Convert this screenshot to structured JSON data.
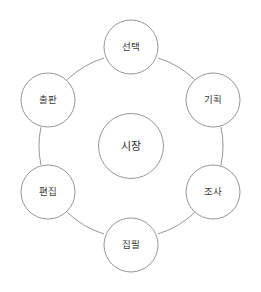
{
  "diagram": {
    "type": "cycle-wheel",
    "title": "",
    "center": {
      "id": "center-node",
      "label": "시장",
      "cx": 131,
      "cy": 146,
      "r": 32.5
    },
    "ring": {
      "cx": 131,
      "cy": 146,
      "r": 92,
      "stroke_color": "#8a8a8a"
    },
    "nodes": [
      {
        "id": "node-top",
        "label": "선택",
        "cx": 131,
        "cy": 47,
        "r": 27,
        "angle_deg": -90
      },
      {
        "id": "node-upper-right",
        "label": "기획",
        "cx": 213,
        "cy": 100,
        "r": 27,
        "angle_deg": -30
      },
      {
        "id": "node-lower-right",
        "label": "조사",
        "cx": 213,
        "cy": 192,
        "r": 27,
        "angle_deg": 30
      },
      {
        "id": "node-bottom",
        "label": "집필",
        "cx": 131,
        "cy": 245,
        "r": 27,
        "angle_deg": 90
      },
      {
        "id": "node-lower-left",
        "label": "편집",
        "cx": 48,
        "cy": 192,
        "r": 27,
        "angle_deg": 150
      },
      {
        "id": "node-upper-left",
        "label": "출판",
        "cx": 48,
        "cy": 100,
        "r": 27,
        "angle_deg": 210
      }
    ],
    "connectors": [
      {
        "from": "node-top",
        "to": "node-upper-right"
      },
      {
        "from": "node-upper-right",
        "to": "node-lower-right"
      },
      {
        "from": "node-lower-right",
        "to": "node-bottom"
      },
      {
        "from": "node-bottom",
        "to": "node-lower-left"
      },
      {
        "from": "node-lower-left",
        "to": "node-upper-left"
      },
      {
        "from": "node-upper-left",
        "to": "node-top"
      }
    ],
    "colors": {
      "background": "#ffffff",
      "stroke": "#8a8a8a",
      "node_fill": "#ffffff",
      "label_text": "#3b3b3b",
      "center_text": "#2e2e2e"
    }
  }
}
